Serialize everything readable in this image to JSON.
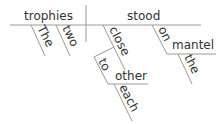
{
  "diagram": {
    "type": "sentence-diagram",
    "subject": "trophies",
    "verb": "stood",
    "subject_modifiers": [
      "The",
      "two"
    ],
    "verb_modifiers": [
      {
        "word": "close",
        "phrase": {
          "preposition": "to",
          "object": "other",
          "object_modifier": "each"
        }
      },
      {
        "word": "on",
        "phrase": {
          "preposition": "on",
          "object": "mantel",
          "object_modifier": "the"
        }
      }
    ]
  },
  "words": {
    "trophies": "trophies",
    "stood": "stood",
    "the1": "The",
    "two": "two",
    "close": "close",
    "to": "to",
    "other": "other",
    "each": "each",
    "on": "on",
    "mantel": "mantel",
    "the2": "the"
  },
  "colors": {
    "line": "#9a9a9a",
    "text": "#333333",
    "background": "#ffffff"
  }
}
